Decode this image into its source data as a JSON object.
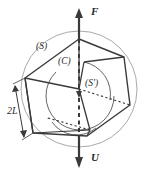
{
  "figure": {
    "canvas": {
      "width": 153,
      "height": 172,
      "background": "#ffffff"
    },
    "colors": {
      "outline": "#3a3a3a",
      "sphere": "#a9a9a9",
      "inner_arc": "#555555",
      "axis": "#3a3a3a",
      "text": "#2b2b2b"
    },
    "labels": {
      "force_top": "F",
      "velocity_bottom": "U",
      "surface_outer": "(S)",
      "body_cube": "(C)",
      "surface_inner": "(S')",
      "dimension_side": "2L"
    },
    "annotations": {
      "axis_style": "solid above body, dashed through body",
      "arrow_top_direction": "up",
      "arrow_bottom_direction": "down",
      "dimension_arrow": "double-headed",
      "hidden_edges": "dotted"
    }
  }
}
